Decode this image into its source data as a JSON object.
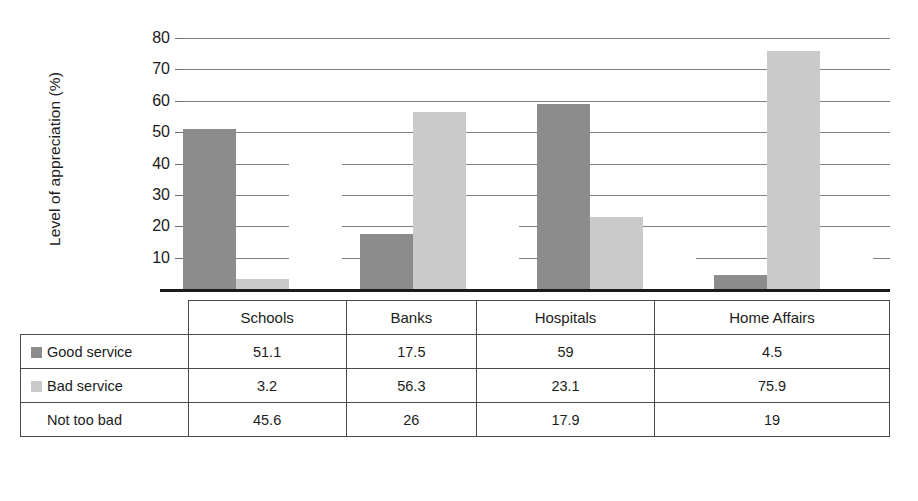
{
  "chart_data": {
    "type": "bar",
    "title": "",
    "subtitle": "",
    "xlabel": "",
    "ylabel": "Level of appreciation (%)",
    "ylim": [
      0,
      80
    ],
    "ytick_step": 10,
    "yticks": [
      10,
      20,
      30,
      40,
      50,
      60,
      70,
      80
    ],
    "grid": true,
    "legend_position": "table-row-labels",
    "categories": [
      "Schools",
      "Banks",
      "Hospitals",
      "Home Affairs"
    ],
    "series": [
      {
        "name": "Good service",
        "color": "#8c8c8c",
        "values": [
          51.1,
          17.5,
          59,
          4.5
        ],
        "display_values": [
          "51.1",
          "17.5",
          "59",
          "4.5"
        ]
      },
      {
        "name": "Bad service",
        "color": "#cacaca",
        "values": [
          3.2,
          56.3,
          23.1,
          75.9
        ],
        "display_values": [
          "3.2",
          "56.3",
          "23.1",
          "75.9"
        ]
      },
      {
        "name": "Not too bad",
        "color": "#ffffff",
        "values": [
          45.6,
          26,
          17.9,
          19
        ],
        "display_values": [
          "45.6",
          "26",
          "17.9",
          "19"
        ]
      }
    ]
  },
  "axis": {
    "y_title": "Level of appreciation (%)",
    "tick_labels": [
      "80",
      "70",
      "60",
      "50",
      "40",
      "30",
      "20",
      "10"
    ]
  },
  "table": {
    "corner_label": "",
    "column_headers": [
      "Schools",
      "Banks",
      "Hospitals",
      "Home Affairs"
    ],
    "rows": [
      {
        "label": "Good service",
        "swatch_color": "#8c8c8c",
        "cells": [
          "51.1",
          "17.5",
          "59",
          "4.5"
        ]
      },
      {
        "label": "Bad service",
        "swatch_color": "#cacaca",
        "cells": [
          "3.2",
          "56.3",
          "23.1",
          "75.9"
        ]
      },
      {
        "label": "Not too bad",
        "swatch_color": "#ffffff",
        "cells": [
          "45.6",
          "26",
          "17.9",
          "19"
        ]
      }
    ]
  }
}
